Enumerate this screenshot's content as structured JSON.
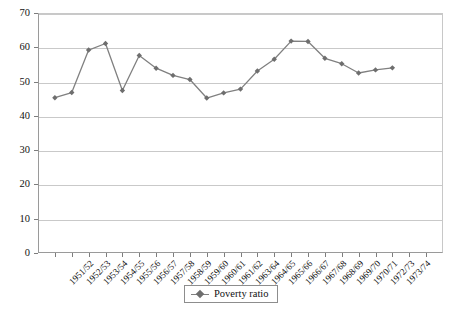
{
  "chart_data": {
    "type": "line",
    "title": "",
    "xlabel": "",
    "ylabel": "",
    "ylim": [
      0,
      70
    ],
    "ytick_step": 10,
    "yticks": [
      0,
      10,
      20,
      30,
      40,
      50,
      60,
      70
    ],
    "grid": "horizontal",
    "legend_position": "bottom-center",
    "marker": "diamond",
    "line_color": "#808080",
    "marker_color": "#6e6e6e",
    "gridline_color": "#c9c9c9",
    "axis_color": "#9a9a9a",
    "series": [
      {
        "name": "Poverty ratio",
        "values": [
          45.3,
          46.8,
          59.2,
          61.1,
          47.4,
          57.6,
          53.9,
          51.8,
          50.6,
          45.2,
          46.7,
          47.8,
          53.1,
          56.5,
          61.8,
          61.7,
          56.8,
          55.2,
          52.5,
          53.4,
          54.0
        ]
      }
    ],
    "categories": [
      "1951/52",
      "1952/53",
      "1953/54",
      "1954/55",
      "1955/56",
      "1956/57",
      "1957/58",
      "1958/59",
      "1959/60",
      "1960/61",
      "1961/62",
      "1963/64",
      "1964/65",
      "1965/66",
      "1966/67",
      "1967/68",
      "1968/69",
      "1969/70",
      "1970/71",
      "1972/73",
      "1973/74"
    ],
    "xtick_count": 23
  },
  "legend": {
    "entries": [
      {
        "label": "Poverty ratio"
      }
    ]
  }
}
